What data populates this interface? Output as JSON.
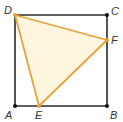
{
  "diagram": {
    "type": "geometry",
    "colors": {
      "square_stroke": "#2b2b2b",
      "triangle_stroke": "#e9a23b",
      "triangle_fill": "#fff6e0",
      "point": "#111111",
      "label": "#333333"
    },
    "points": {
      "A": {
        "label": "A",
        "x": 15,
        "y": 106
      },
      "B": {
        "label": "B",
        "x": 107,
        "y": 106
      },
      "C": {
        "label": "C",
        "x": 107,
        "y": 15
      },
      "D": {
        "label": "D",
        "x": 15,
        "y": 15
      },
      "E": {
        "label": "E",
        "x": 39,
        "y": 106
      },
      "F": {
        "label": "F",
        "x": 107,
        "y": 40
      }
    },
    "shapes": {
      "square": [
        "A",
        "B",
        "C",
        "D"
      ],
      "triangle": [
        "D",
        "E",
        "F"
      ]
    }
  }
}
